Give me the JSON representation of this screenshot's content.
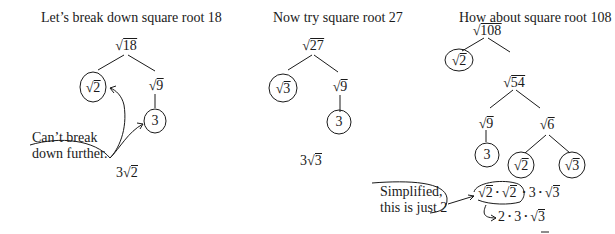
{
  "panels": [
    {
      "title": "Let’s break down square root 18",
      "root": "18",
      "left_leaf": "2",
      "right_node": "9",
      "right_leaf": "3",
      "note_line1": "Can’t break",
      "note_line2": "down further.",
      "result_coef": "3",
      "result_rad": "2"
    },
    {
      "title": "Now try square root 27",
      "root": "27",
      "left_leaf": "3",
      "right_node": "9",
      "right_leaf": "3",
      "result_coef": "3",
      "result_rad": "3"
    },
    {
      "title": "How about square root 108",
      "root": "108",
      "left_leaf": "2",
      "right_node": "54",
      "sub_left": "9",
      "sub_left_leaf": "3",
      "sub_right": "6",
      "sub_right_left": "2",
      "sub_right_right": "3",
      "note_line1": "Simplified,",
      "note_line2": "this is just 2",
      "step1": {
        "r1": "2",
        "r2": "2",
        "n": "3",
        "r3": "3"
      },
      "step2": {
        "a": "2",
        "b": "3",
        "r": "3"
      }
    }
  ],
  "symbols": {
    "radical": "√",
    "dot": "•"
  }
}
